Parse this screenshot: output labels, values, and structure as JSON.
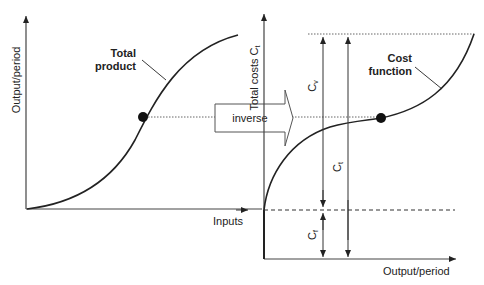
{
  "left_chart": {
    "y_label": "Output/period",
    "x_label": "Inputs",
    "curve_label_line1": "Total",
    "curve_label_line2": "product"
  },
  "center": {
    "arrow_label": "inverse"
  },
  "right_chart": {
    "y_label": "Total costs C",
    "y_label_sub": "t",
    "x_label": "Output/period",
    "curve_label_line1": "Cost",
    "curve_label_line2": "function",
    "cv_label": "C",
    "cv_sub": "v",
    "ct_label": "C",
    "ct_sub": "t",
    "cf_label": "C",
    "cf_sub": "f"
  },
  "colors": {
    "line": "#222222",
    "dotted": "#555555"
  }
}
